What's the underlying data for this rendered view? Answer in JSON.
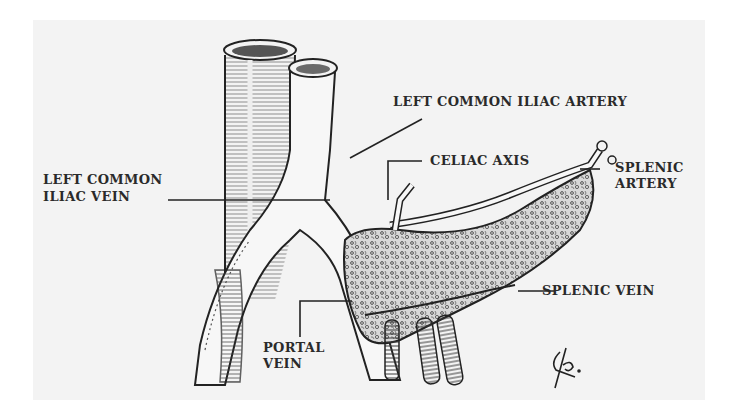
{
  "figure": {
    "type": "anatomical illustration",
    "background_color": "#f3f3f3",
    "ink_color": "#2a2a2a",
    "signature": "Lβ."
  },
  "labels": {
    "left_common_iliac_artery": "LEFT COMMON ILIAC ARTERY",
    "celiac_axis": "CELIAC AXIS",
    "splenic_artery_line1": "SPLENIC",
    "splenic_artery_line2": "ARTERY",
    "left_common_iliac_vein_line1": "LEFT COMMON",
    "left_common_iliac_vein_line2": "ILIAC VEIN",
    "splenic_vein": "SPLENIC VEIN",
    "portal_vein_line1": "PORTAL",
    "portal_vein_line2": "VEIN"
  }
}
